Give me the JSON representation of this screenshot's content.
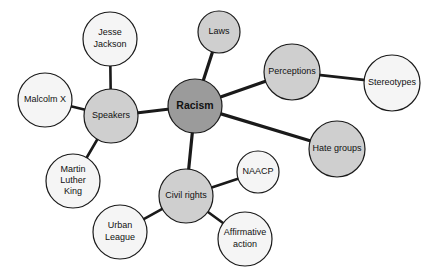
{
  "diagram": {
    "type": "concept-map",
    "background_color": "#ffffff",
    "edge_color": "#1a1a1a",
    "node_border_color": "#1a1a1a",
    "text_color": "#111111",
    "fills": {
      "central": "#9b9b9b",
      "branch": "#cfcfcf",
      "leaf": "#f5f5f5"
    },
    "nodes": [
      {
        "id": "racism",
        "label": "Racism",
        "lines": [
          "Racism"
        ],
        "cx": 195,
        "cy": 106,
        "r": 27,
        "fill": "#9b9b9b",
        "font_size": 10.5,
        "bold": true,
        "role": "central"
      },
      {
        "id": "speakers",
        "label": "Speakers",
        "lines": [
          "Speakers"
        ],
        "cx": 111,
        "cy": 116,
        "r": 27,
        "fill": "#cfcfcf",
        "font_size": 9,
        "bold": false,
        "role": "branch"
      },
      {
        "id": "laws",
        "label": "Laws",
        "lines": [
          "Laws"
        ],
        "cx": 219,
        "cy": 32,
        "r": 21,
        "fill": "#cfcfcf",
        "font_size": 9,
        "bold": false,
        "role": "branch"
      },
      {
        "id": "perceptions",
        "label": "Perceptions",
        "lines": [
          "Perceptions"
        ],
        "cx": 292,
        "cy": 72,
        "r": 28,
        "fill": "#cfcfcf",
        "font_size": 9,
        "bold": false,
        "role": "branch"
      },
      {
        "id": "hate-groups",
        "label": "Hate groups",
        "lines": [
          "Hate groups"
        ],
        "cx": 337,
        "cy": 149,
        "r": 28,
        "fill": "#cfcfcf",
        "font_size": 9,
        "bold": false,
        "role": "branch"
      },
      {
        "id": "civil-rights",
        "label": "Civil rights",
        "lines": [
          "Civil rights"
        ],
        "cx": 186,
        "cy": 196,
        "r": 27,
        "fill": "#cfcfcf",
        "font_size": 9,
        "bold": false,
        "role": "branch"
      },
      {
        "id": "jesse-jackson",
        "label": "Jesse Jackson",
        "lines": [
          "Jesse",
          "Jackson"
        ],
        "cx": 110,
        "cy": 39,
        "r": 27,
        "fill": "#f5f5f5",
        "font_size": 9,
        "bold": false,
        "role": "leaf"
      },
      {
        "id": "malcolm-x",
        "label": "Malcolm X",
        "lines": [
          "Malcolm X"
        ],
        "cx": 45,
        "cy": 100,
        "r": 27,
        "fill": "#f5f5f5",
        "font_size": 9,
        "bold": false,
        "role": "leaf"
      },
      {
        "id": "martin-luther-king",
        "label": "Martin Luther King",
        "lines": [
          "Martin",
          "Luther",
          "King"
        ],
        "cx": 73,
        "cy": 181,
        "r": 27,
        "fill": "#f5f5f5",
        "font_size": 9,
        "bold": false,
        "role": "leaf"
      },
      {
        "id": "stereotypes",
        "label": "Stereotypes",
        "lines": [
          "Stereotypes"
        ],
        "cx": 392,
        "cy": 83,
        "r": 28,
        "fill": "#f5f5f5",
        "font_size": 9,
        "bold": false,
        "role": "leaf"
      },
      {
        "id": "naacp",
        "label": "NAACP",
        "lines": [
          "NAACP"
        ],
        "cx": 258,
        "cy": 172,
        "r": 21,
        "fill": "#f5f5f5",
        "font_size": 9,
        "bold": false,
        "role": "leaf"
      },
      {
        "id": "affirmative-action",
        "label": "Affirmative action",
        "lines": [
          "Affirmative",
          "action"
        ],
        "cx": 245,
        "cy": 239,
        "r": 27,
        "fill": "#f5f5f5",
        "font_size": 9,
        "bold": false,
        "role": "leaf"
      },
      {
        "id": "urban-league",
        "label": "Urban League",
        "lines": [
          "Urban",
          "League"
        ],
        "cx": 120,
        "cy": 232,
        "r": 27,
        "fill": "#f5f5f5",
        "font_size": 9,
        "bold": false,
        "role": "leaf"
      }
    ],
    "edges": [
      {
        "id": "racism-speakers",
        "from": "racism",
        "to": "speakers",
        "width": 3.2
      },
      {
        "id": "racism-laws",
        "from": "racism",
        "to": "laws",
        "width": 3.2
      },
      {
        "id": "racism-perceptions",
        "from": "racism",
        "to": "perceptions",
        "width": 3.2
      },
      {
        "id": "racism-hate-groups",
        "from": "racism",
        "to": "hate-groups",
        "width": 3.2
      },
      {
        "id": "racism-civil-rights",
        "from": "racism",
        "to": "civil-rights",
        "width": 3.2
      },
      {
        "id": "perceptions-stereotypes",
        "from": "perceptions",
        "to": "stereotypes",
        "width": 2.6
      },
      {
        "id": "speakers-jesse-jackson",
        "from": "speakers",
        "to": "jesse-jackson",
        "width": 2.6
      },
      {
        "id": "speakers-malcolm-x",
        "from": "speakers",
        "to": "malcolm-x",
        "width": 2.6
      },
      {
        "id": "speakers-martin-luther-king",
        "from": "speakers",
        "to": "martin-luther-king",
        "width": 2.6
      },
      {
        "id": "civil-rights-naacp",
        "from": "civil-rights",
        "to": "naacp",
        "width": 2.6
      },
      {
        "id": "civil-rights-affirmative-action",
        "from": "civil-rights",
        "to": "affirmative-action",
        "width": 2.6
      },
      {
        "id": "civil-rights-urban-league",
        "from": "civil-rights",
        "to": "urban-league",
        "width": 2.6
      }
    ]
  }
}
